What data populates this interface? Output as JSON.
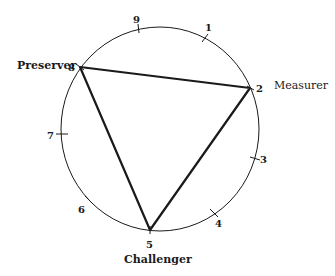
{
  "diagram": {
    "type": "enneagram-triad",
    "circle": {
      "cx": 160,
      "cy": 129,
      "rx": 99,
      "ry": 102
    },
    "points": [
      {
        "n": "1",
        "tick": [
          205,
          38
        ],
        "label_pos": [
          207,
          29
        ]
      },
      {
        "n": "2",
        "tick": [
          250,
          88
        ],
        "label_pos": [
          258,
          91
        ]
      },
      {
        "n": "3",
        "tick": [
          255,
          158
        ],
        "label_pos": [
          261,
          162
        ]
      },
      {
        "n": "4",
        "tick": [
          214,
          213
        ],
        "label_pos": [
          216,
          225
        ]
      },
      {
        "n": "5",
        "tick": [
          150,
          230
        ],
        "label_pos": [
          147,
          247
        ]
      },
      {
        "n": "6",
        "tick": [
          89,
          200
        ],
        "label_pos": [
          80,
          211
        ]
      },
      {
        "n": "7",
        "tick": [
          62,
          134
        ],
        "label_pos": [
          48,
          138
        ]
      },
      {
        "n": "8",
        "tick": [
          80,
          67
        ],
        "label_pos": [
          69,
          70
        ]
      },
      {
        "n": "9",
        "tick": [
          138,
          29
        ],
        "label_pos": [
          134,
          22
        ]
      }
    ],
    "triangle": [
      "8",
      "2",
      "5"
    ],
    "roles": {
      "preserver": "Preserver",
      "measurer": "Measurer",
      "challenger": "Challenger"
    },
    "ink_color": "#1a1a1a"
  }
}
